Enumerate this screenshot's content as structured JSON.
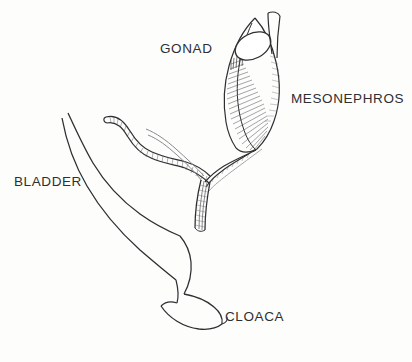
{
  "figure": {
    "name": "urogenital-system-diagram",
    "background_color": "#fdfdfb",
    "ink_color": "#2f2f33",
    "width": 412,
    "height": 362
  },
  "labels": {
    "gonad": "GONAD",
    "mesonephros": "MESONEPHROS",
    "bladder": "BLADDER",
    "cloaca": "CLOACA"
  },
  "structures": {
    "gonad": "gonad-oval",
    "mesonephros": "mesonephros-hatched-body",
    "oviduct": "mullerian-duct-wavy-tube",
    "wolffian_duct": "wolffian-duct",
    "bladder": "bladder-outline",
    "cloaca": "cloaca-outline"
  }
}
